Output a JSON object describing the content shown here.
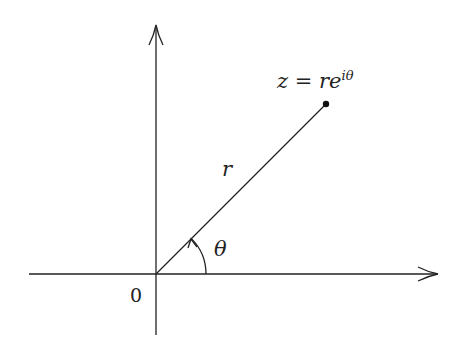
{
  "diagram": {
    "type": "complex-plane-polar-form",
    "point_label": "z = re^{iθ}",
    "point_label_parts": {
      "lhs": "z",
      "eq": "=",
      "r": "r",
      "e": "e",
      "exp": "iθ"
    },
    "radius_label": "r",
    "angle_label": "θ",
    "origin_label": "0",
    "colors": {
      "stroke": "#222222",
      "background": "#ffffff"
    }
  }
}
